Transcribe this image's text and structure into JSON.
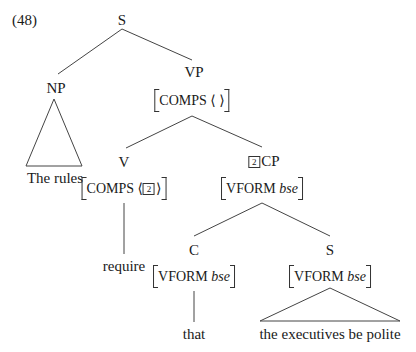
{
  "example_number": "(48)",
  "tree": {
    "root": {
      "label": "S"
    },
    "np": {
      "label": "NP",
      "yield": "The rules"
    },
    "vp": {
      "label": "VP",
      "avm": {
        "feature": "COMPS",
        "value": "⟨  ⟩"
      }
    },
    "v": {
      "label": "V",
      "avm": {
        "feature": "COMPS",
        "value_tag": "2"
      },
      "yield": "require"
    },
    "cp": {
      "label": "CP",
      "tag": "2",
      "avm": {
        "feature": "VFORM",
        "value": "bse"
      }
    },
    "c": {
      "label": "C",
      "avm": {
        "feature": "VFORM",
        "value": "bse"
      },
      "yield": "that"
    },
    "s": {
      "label": "S",
      "avm": {
        "feature": "VFORM",
        "value": "bse"
      },
      "yield": "the executives be polite"
    }
  }
}
